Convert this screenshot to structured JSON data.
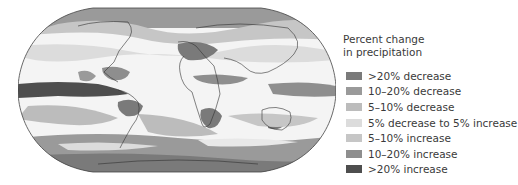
{
  "figure": {
    "type": "world-map",
    "projection": "robinson"
  },
  "legend": {
    "title_line1": "Percent change",
    "title_line2": "in precipitation",
    "items": [
      {
        "label": ">20% decrease",
        "color": "#7a7a7a"
      },
      {
        "label": "10–20% decrease",
        "color": "#9a9a9a"
      },
      {
        "label": "5–10% decrease",
        "color": "#bcbcbc"
      },
      {
        "label": "5% decrease to 5% increase",
        "color": "#dcdcdc"
      },
      {
        "label": "5–10% increase",
        "color": "#c6c6c6"
      },
      {
        "label": "10–20% increase",
        "color": "#8e8e8e"
      },
      {
        "label": ">20% increase",
        "color": "#4e4e4e"
      }
    ]
  }
}
